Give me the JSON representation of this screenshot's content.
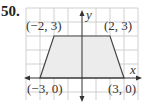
{
  "problem_number": "50.",
  "diagram": {
    "type": "trapezoid on coordinate grid",
    "x_axis_label": "x",
    "y_axis_label": "y",
    "vertices": [
      {
        "label": "(−2, 3)",
        "x": -2,
        "y": 3
      },
      {
        "label": "(2, 3)",
        "x": 2,
        "y": 3
      },
      {
        "label": "(3, 0)",
        "x": 3,
        "y": 0
      },
      {
        "label": "(−3, 0)",
        "x": -3,
        "y": 0
      }
    ],
    "colors": {
      "fill": "#ececec",
      "grid": "#d0d0d0",
      "edge": "#444444"
    }
  }
}
